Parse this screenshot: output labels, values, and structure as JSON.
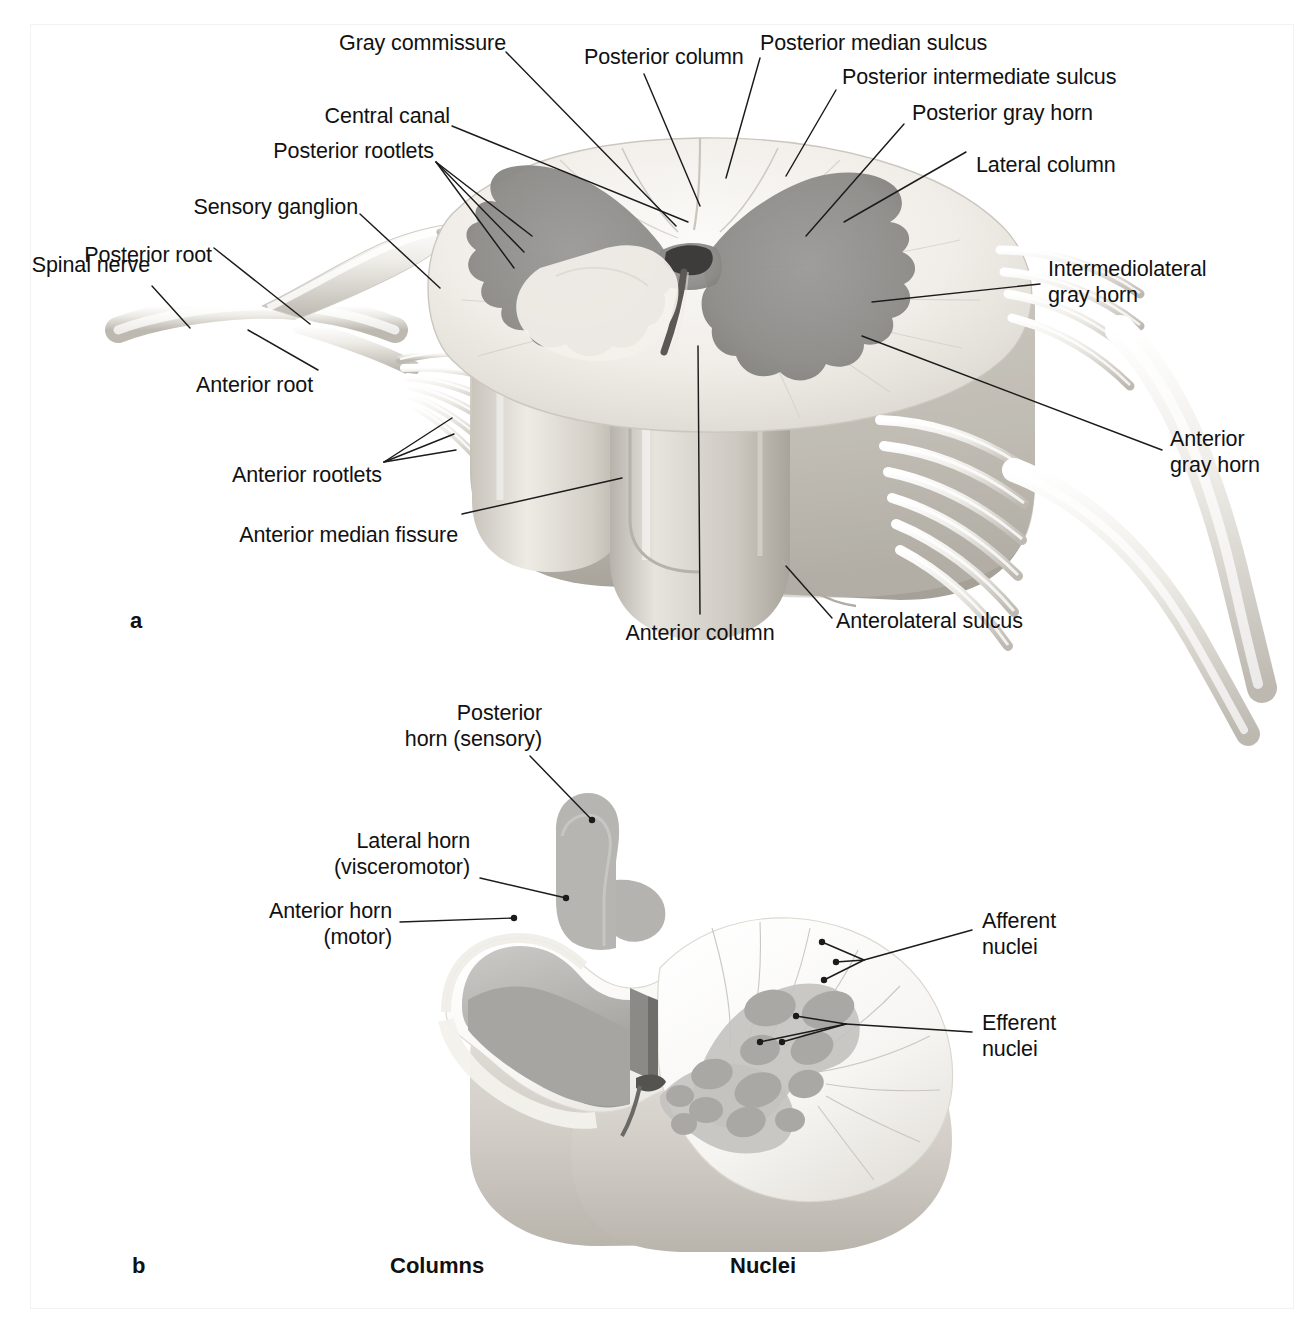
{
  "figure": {
    "type": "anatomical-illustration",
    "panels": [
      {
        "id": "a",
        "letter": "a",
        "caption_titles": []
      },
      {
        "id": "b",
        "letter": "b",
        "caption_titles": [
          "Columns",
          "Nuclei"
        ]
      }
    ]
  },
  "panel_a": {
    "letter": "a",
    "labels": [
      {
        "id": "gray-commissure",
        "text": "Gray commissure"
      },
      {
        "id": "posterior-column",
        "text": "Posterior column"
      },
      {
        "id": "posterior-median-sulcus",
        "text": "Posterior median sulcus"
      },
      {
        "id": "posterior-intermediate-sulcus",
        "text": "Posterior intermediate sulcus"
      },
      {
        "id": "posterior-gray-horn",
        "text": "Posterior gray horn"
      },
      {
        "id": "lateral-column",
        "text": "Lateral column"
      },
      {
        "id": "central-canal",
        "text": "Central canal"
      },
      {
        "id": "posterior-rootlets",
        "text": "Posterior rootlets"
      },
      {
        "id": "sensory-ganglion",
        "text": "Sensory ganglion"
      },
      {
        "id": "posterior-root",
        "text": "Posterior root"
      },
      {
        "id": "spinal-nerve",
        "text": "Spinal nerve"
      },
      {
        "id": "intermediolateral-gray-horn",
        "text_line1": "Intermediolateral",
        "text_line2": "gray horn"
      },
      {
        "id": "anterior-gray-horn",
        "text_line1": "Anterior",
        "text_line2": "gray horn"
      },
      {
        "id": "anterior-root",
        "text": "Anterior root"
      },
      {
        "id": "anterior-rootlets",
        "text": "Anterior rootlets"
      },
      {
        "id": "anterior-median-fissure",
        "text": "Anterior median fissure"
      },
      {
        "id": "anterior-column",
        "text": "Anterior column"
      },
      {
        "id": "anterolateral-sulcus",
        "text": "Anterolateral sulcus"
      }
    ]
  },
  "panel_b": {
    "letter": "b",
    "column_heading": "Columns",
    "nuclei_heading": "Nuclei",
    "labels": [
      {
        "id": "posterior-horn-sensory",
        "text_line1": "Posterior",
        "text_line2": "horn (sensory)"
      },
      {
        "id": "lateral-horn-visceromotor",
        "text_line1": "Lateral horn",
        "text_line2": "(visceromotor)"
      },
      {
        "id": "anterior-horn-motor",
        "text_line1": "Anterior horn",
        "text_line2": "(motor)"
      },
      {
        "id": "afferent-nuclei",
        "text_line1": "Afferent",
        "text_line2": "nuclei"
      },
      {
        "id": "efferent-nuclei",
        "text_line1": "Efferent",
        "text_line2": "nuclei"
      }
    ]
  },
  "colors": {
    "background": "#ffffff",
    "text": "#111111",
    "leader_line": "#1b1b1b",
    "white_matter": "#f4f2ee",
    "white_matter_shadow": "#cfcbc4",
    "gray_matter_a": "#8e8d8b",
    "gray_matter_b_light": "#c6c5c2",
    "gray_matter_b_mid": "#aeadaa",
    "gray_matter_b_dark": "#989794",
    "nucleus_dot": "#a9a8a4",
    "nerve": "#e9e7e2",
    "page_border": "#f2f2f2"
  }
}
